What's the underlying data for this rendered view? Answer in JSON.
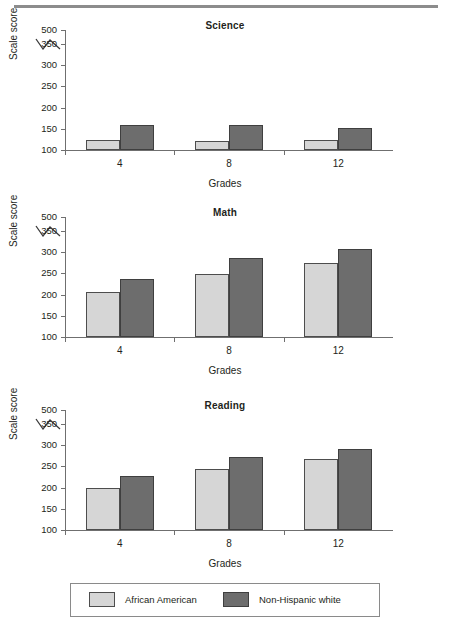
{
  "chart_data": [
    {
      "type": "bar",
      "title": "Science",
      "xlabel": "Grades",
      "ylabel": "Scale score",
      "categories": [
        "4",
        "8",
        "12"
      ],
      "yticks": [
        100,
        150,
        200,
        250,
        300,
        350,
        500
      ],
      "ylim": [
        100,
        370
      ],
      "axis_break": true,
      "axis_break_between": [
        350,
        500
      ],
      "grid": false,
      "legend_position": "bottom",
      "series": [
        {
          "name": "African American",
          "color": "#d6d6d6",
          "values": [
            123,
            121,
            124
          ]
        },
        {
          "name": "Non-Hispanic white",
          "color": "#6d6d6d",
          "values": [
            159,
            160,
            153
          ]
        }
      ]
    },
    {
      "type": "bar",
      "title": "Math",
      "xlabel": "Grades",
      "ylabel": "Scale score",
      "categories": [
        "4",
        "8",
        "12"
      ],
      "yticks": [
        100,
        150,
        200,
        250,
        300,
        350,
        500
      ],
      "ylim": [
        100,
        370
      ],
      "axis_break": true,
      "axis_break_between": [
        350,
        500
      ],
      "grid": false,
      "legend_position": "bottom",
      "series": [
        {
          "name": "African American",
          "color": "#d6d6d6",
          "values": [
            205,
            248,
            275
          ]
        },
        {
          "name": "Non-Hispanic white",
          "color": "#6d6d6d",
          "values": [
            236,
            286,
            308
          ]
        }
      ]
    },
    {
      "type": "bar",
      "title": "Reading",
      "xlabel": "Grades",
      "ylabel": "Scale score",
      "categories": [
        "4",
        "8",
        "12"
      ],
      "yticks": [
        100,
        150,
        200,
        250,
        300,
        350,
        500
      ],
      "ylim": [
        100,
        370
      ],
      "axis_break": true,
      "axis_break_between": [
        350,
        500
      ],
      "grid": false,
      "legend_position": "bottom",
      "series": [
        {
          "name": "African American",
          "color": "#d6d6d6",
          "values": [
            198,
            245,
            267
          ]
        },
        {
          "name": "Non-Hispanic white",
          "color": "#6d6d6d",
          "values": [
            228,
            272,
            290
          ]
        }
      ]
    }
  ],
  "legend": {
    "items": [
      {
        "label": "African American",
        "color": "#d6d6d6"
      },
      {
        "label": "Non-Hispanic white",
        "color": "#6d6d6d"
      }
    ]
  },
  "axis": {
    "ytick_labels": [
      "500",
      "350",
      "300",
      "250",
      "200",
      "150",
      "100"
    ],
    "ylabel": "Scale score",
    "xlabel": "Grades",
    "xtick_labels": [
      "4",
      "8",
      "12"
    ]
  }
}
